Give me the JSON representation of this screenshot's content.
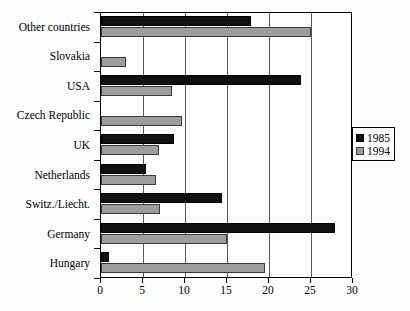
{
  "chart_data": {
    "type": "bar",
    "orientation": "horizontal",
    "title": "",
    "subtitle": "",
    "xlabel": "",
    "ylabel": "",
    "xlim": [
      0,
      30
    ],
    "xticks": [
      0,
      5,
      10,
      15,
      20,
      25,
      30
    ],
    "xtick_labels": [
      "0",
      "5",
      "10",
      "15",
      "20",
      "25",
      "30"
    ],
    "grid": true,
    "grid_axis": "x",
    "legend_position": "right",
    "categories": [
      "Other countries",
      "Slovakia",
      "USA",
      "Czech Republic",
      "UK",
      "Netherlands",
      "Switz./Liecht.",
      "Germany",
      "Hungary"
    ],
    "series": [
      {
        "name": "1985",
        "color": "#111111",
        "values": [
          17.8,
          0,
          23.8,
          0,
          8.7,
          5.4,
          14.4,
          27.9,
          1.0
        ]
      },
      {
        "name": "1994",
        "color": "#9d9d9d",
        "values": [
          25.0,
          3.0,
          8.5,
          9.6,
          6.9,
          6.5,
          7.0,
          15.0,
          19.5
        ]
      }
    ]
  },
  "legend": {
    "items": [
      {
        "label": "1985",
        "swatch": "black-square-icon"
      },
      {
        "label": "1994",
        "swatch": "gray-square-icon"
      }
    ]
  }
}
